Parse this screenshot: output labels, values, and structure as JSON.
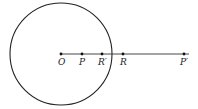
{
  "diagram": {
    "circle": {
      "cx": 61,
      "cy": 54,
      "r": 51,
      "stroke": "#222222"
    },
    "ray": {
      "x1": 61,
      "y1": 54,
      "x2": 189,
      "y2": 54,
      "stroke": "#333333"
    },
    "points": [
      {
        "id": "O",
        "label": "O",
        "x": 61,
        "y": 54
      },
      {
        "id": "P",
        "label": "P",
        "x": 82,
        "y": 54
      },
      {
        "id": "R_prime",
        "label": "R′",
        "x": 102,
        "y": 54
      },
      {
        "id": "R",
        "label": "R",
        "x": 123,
        "y": 54
      },
      {
        "id": "P_prime",
        "label": "P′",
        "x": 184,
        "y": 54
      }
    ]
  }
}
